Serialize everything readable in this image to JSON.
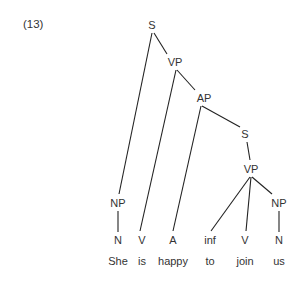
{
  "example_number": "(13)",
  "tree": {
    "nodes": [
      {
        "id": "S1",
        "label": "S",
        "x": 152,
        "y": 25
      },
      {
        "id": "VP1",
        "label": "VP",
        "x": 175,
        "y": 62
      },
      {
        "id": "AP",
        "label": "AP",
        "x": 204,
        "y": 98
      },
      {
        "id": "S2",
        "label": "S",
        "x": 245,
        "y": 134
      },
      {
        "id": "VP2",
        "label": "VP",
        "x": 251,
        "y": 169
      },
      {
        "id": "NP1",
        "label": "NP",
        "x": 118,
        "y": 203
      },
      {
        "id": "NP2",
        "label": "NP",
        "x": 279,
        "y": 203
      },
      {
        "id": "N1",
        "label": "N",
        "x": 118,
        "y": 240
      },
      {
        "id": "V1",
        "label": "V",
        "x": 142,
        "y": 240
      },
      {
        "id": "A",
        "label": "A",
        "x": 173,
        "y": 240
      },
      {
        "id": "INF",
        "label": "inf",
        "x": 210,
        "y": 240
      },
      {
        "id": "V2",
        "label": "V",
        "x": 245,
        "y": 240
      },
      {
        "id": "N2",
        "label": "N",
        "x": 279,
        "y": 240
      }
    ],
    "words": [
      {
        "text": "She",
        "x": 118,
        "y": 261
      },
      {
        "text": "is",
        "x": 142,
        "y": 261
      },
      {
        "text": "happy",
        "x": 173,
        "y": 261
      },
      {
        "text": "to",
        "x": 210,
        "y": 261
      },
      {
        "text": "join",
        "x": 245,
        "y": 261
      },
      {
        "text": "us",
        "x": 279,
        "y": 261
      }
    ],
    "edges": [
      {
        "from": "S1",
        "to": "NP1",
        "x1": 152,
        "y1": 33,
        "x2": 119,
        "y2": 194
      },
      {
        "from": "S1",
        "to": "VP1",
        "x1": 154,
        "y1": 33,
        "x2": 167,
        "y2": 54
      },
      {
        "from": "VP1",
        "to": "V1",
        "x1": 176,
        "y1": 70,
        "x2": 140,
        "y2": 231
      },
      {
        "from": "VP1",
        "to": "AP",
        "x1": 177,
        "y1": 70,
        "x2": 195,
        "y2": 90
      },
      {
        "from": "AP",
        "to": "A",
        "x1": 201,
        "y1": 106,
        "x2": 173,
        "y2": 231
      },
      {
        "from": "AP",
        "to": "S2",
        "x1": 202,
        "y1": 106,
        "x2": 240,
        "y2": 127
      },
      {
        "from": "S2",
        "to": "VP2",
        "x1": 247,
        "y1": 142,
        "x2": 250,
        "y2": 160
      },
      {
        "from": "VP2",
        "to": "INF",
        "x1": 250,
        "y1": 177,
        "x2": 211,
        "y2": 231
      },
      {
        "from": "VP2",
        "to": "V2",
        "x1": 251,
        "y1": 177,
        "x2": 246,
        "y2": 231
      },
      {
        "from": "VP2",
        "to": "NP2",
        "x1": 252,
        "y1": 177,
        "x2": 272,
        "y2": 194
      },
      {
        "from": "NP2",
        "to": "N2",
        "x1": 279,
        "y1": 211,
        "x2": 279,
        "y2": 232
      },
      {
        "from": "NP1",
        "to": "N1",
        "x1": 118,
        "y1": 211,
        "x2": 118,
        "y2": 232
      }
    ]
  },
  "colors": {
    "line": "#222222",
    "text": "#333333",
    "background": "#ffffff"
  }
}
